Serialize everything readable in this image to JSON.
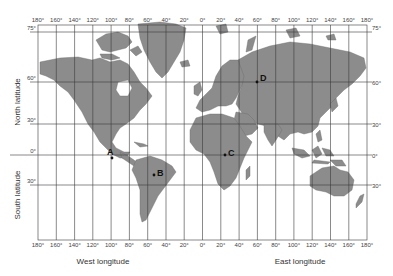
{
  "map": {
    "projection": "Mercator world map",
    "colors": {
      "land": "#8c8c8c",
      "land_stroke": "#5a5a5a",
      "ocean": "#ffffff",
      "grid": "#3a3a3a",
      "point": "#111111"
    },
    "longitude_ticks_top": [
      "180°",
      "160°",
      "140°",
      "120°",
      "100°",
      "80°",
      "60°",
      "40°",
      "20°",
      "0°",
      "20°",
      "40°",
      "60°",
      "80°",
      "100°",
      "120°",
      "140°",
      "160°",
      "180°"
    ],
    "longitude_ticks_bottom": [
      "180°",
      "160°",
      "140°",
      "120°",
      "100°",
      "80°",
      "60°",
      "40°",
      "20°",
      "0°",
      "20°",
      "40°",
      "60°",
      "80°",
      "100°",
      "120°",
      "140°",
      "160°",
      "180°"
    ],
    "latitude_ticks_left": [
      "75°",
      "60°",
      "30°",
      "0°",
      "30°"
    ],
    "latitude_ticks_right": [
      "75°",
      "60°",
      "30°",
      "0°",
      "30°"
    ],
    "axis_labels": {
      "west": "West longitude",
      "east": "East longitude",
      "north": "North latitude",
      "south": "South latitude"
    },
    "points": [
      {
        "label": "A",
        "lat": 20,
        "lon": -100
      },
      {
        "label": "B",
        "lat": -15,
        "lon": -50
      },
      {
        "label": "C",
        "lat": 0,
        "lon": 25
      },
      {
        "label": "D",
        "lat": 60,
        "lon": 60
      }
    ]
  }
}
